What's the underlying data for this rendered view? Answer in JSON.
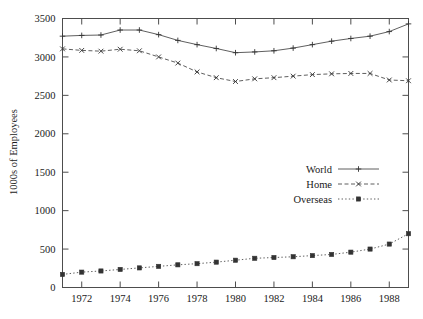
{
  "chart_data": {
    "type": "line",
    "title": "",
    "xlabel": "",
    "ylabel": "1000s of Employees",
    "xlim": [
      1971,
      1989
    ],
    "ylim": [
      0,
      3500
    ],
    "grid": false,
    "legend_position": "center-right-inside",
    "x": [
      1971,
      1972,
      1973,
      1974,
      1975,
      1976,
      1977,
      1978,
      1979,
      1980,
      1981,
      1982,
      1983,
      1984,
      1985,
      1986,
      1987,
      1988,
      1989
    ],
    "xtick_labels": [
      "1972",
      "1974",
      "1976",
      "1978",
      "1980",
      "1982",
      "1984",
      "1986",
      "1988"
    ],
    "xtick_values": [
      1972,
      1974,
      1976,
      1978,
      1980,
      1982,
      1984,
      1986,
      1988
    ],
    "ytick_labels": [
      "0",
      "500",
      "1000",
      "1500",
      "2000",
      "2500",
      "3000",
      "3500"
    ],
    "ytick_values": [
      0,
      500,
      1000,
      1500,
      2000,
      2500,
      3000,
      3500
    ],
    "series": [
      {
        "name": "World",
        "marker": "plus",
        "dash": "solid",
        "values": [
          3270,
          3280,
          3285,
          3350,
          3350,
          3290,
          3215,
          3160,
          3110,
          3055,
          3065,
          3080,
          3115,
          3160,
          3205,
          3240,
          3270,
          3330,
          3430
        ]
      },
      {
        "name": "Home",
        "marker": "cross",
        "dash": "dashed",
        "values": [
          3105,
          3085,
          3075,
          3100,
          3080,
          3000,
          2920,
          2805,
          2730,
          2680,
          2715,
          2730,
          2750,
          2770,
          2780,
          2785,
          2785,
          2700,
          2690
        ]
      },
      {
        "name": "Overseas",
        "marker": "square",
        "dash": "dotted",
        "values": [
          170,
          200,
          215,
          235,
          255,
          275,
          295,
          310,
          330,
          355,
          380,
          390,
          400,
          415,
          430,
          460,
          500,
          565,
          700
        ]
      }
    ]
  },
  "legend": {
    "entries": [
      {
        "label": "World"
      },
      {
        "label": "Home"
      },
      {
        "label": "Overseas"
      }
    ]
  },
  "axes": {
    "y_title": "1000s of Employees"
  }
}
